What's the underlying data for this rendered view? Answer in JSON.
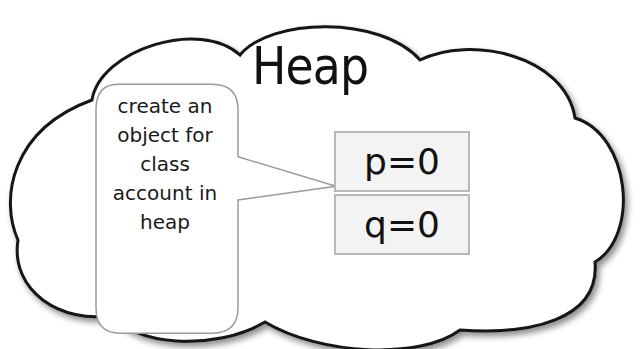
{
  "diagram": {
    "title": "Heap",
    "callout": {
      "lines": [
        "create an",
        "object for",
        "class",
        "account in",
        "heap"
      ]
    },
    "object_fields": [
      {
        "label": "p=0"
      },
      {
        "label": "q=0"
      }
    ]
  }
}
